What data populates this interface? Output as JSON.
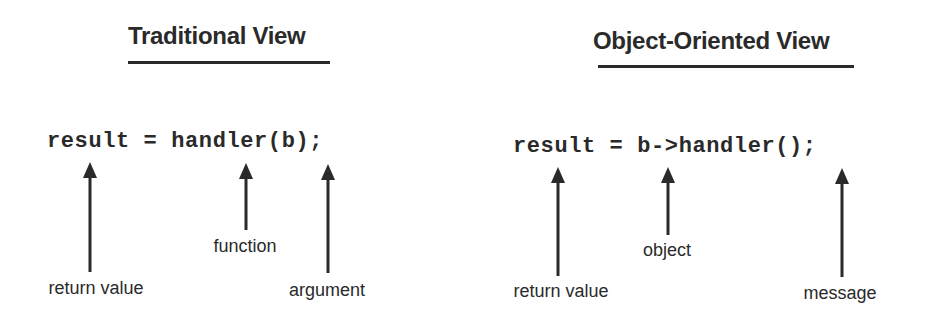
{
  "diagram": {
    "panels": [
      {
        "id": "traditional",
        "title": "Traditional View",
        "code": "result = handler(b);",
        "annotations": [
          {
            "label": "return value",
            "target": "result"
          },
          {
            "label": "function",
            "target": "handler"
          },
          {
            "label": "argument",
            "target": "b"
          }
        ]
      },
      {
        "id": "object-oriented",
        "title": "Object-Oriented View",
        "code": "result = b->handler();",
        "annotations": [
          {
            "label": "return value",
            "target": "result"
          },
          {
            "label": "object",
            "target": "b"
          },
          {
            "label": "message",
            "target": "()"
          }
        ]
      }
    ],
    "colors": {
      "ink": "#2a2a2a",
      "background": "#ffffff"
    }
  }
}
